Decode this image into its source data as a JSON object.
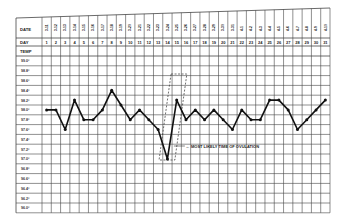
{
  "chart_data": {
    "type": "line",
    "title": "",
    "row_labels": {
      "date": "DATE",
      "day": "DAY",
      "temp": "TEMP"
    },
    "dates": [
      "3-11",
      "3-12",
      "3-13",
      "3-14",
      "3-15",
      "3-16",
      "3-17",
      "3-18",
      "3-19",
      "3-20",
      "3-21",
      "3-22",
      "3-23",
      "3-24",
      "3-25",
      "3-26",
      "3-27",
      "3-28",
      "3-29",
      "3-30",
      "3-31",
      "4-1",
      "4-2",
      "4-3",
      "4-4",
      "4-5",
      "4-6",
      "4-7",
      "4-8",
      "4-9",
      "4-10"
    ],
    "days": [
      1,
      2,
      3,
      4,
      5,
      6,
      7,
      8,
      9,
      10,
      11,
      12,
      13,
      14,
      15,
      16,
      17,
      18,
      19,
      20,
      21,
      22,
      23,
      24,
      25,
      26,
      27,
      28,
      29,
      30,
      31
    ],
    "y_tick_labels": [
      "99.0°",
      "98.8°",
      "98.6°",
      "98.4°",
      "98.2°",
      "98.0°",
      "97.8°",
      "97.6°",
      "97.4°",
      "97.2°",
      "97.0°",
      "96.8°",
      "96.6°",
      "96.4°",
      "96.2°",
      "96.0°"
    ],
    "ylabel": "TEMP",
    "xlabel": "DAY",
    "ylim": [
      96.0,
      99.0
    ],
    "grid": true,
    "series": [
      {
        "name": "Basal body temperature",
        "values": [
          98.0,
          98.0,
          97.6,
          98.2,
          97.8,
          97.8,
          98.0,
          98.4,
          98.1,
          97.8,
          98.0,
          97.8,
          97.6,
          97.0,
          98.2,
          97.8,
          98.0,
          97.8,
          98.0,
          97.8,
          97.6,
          98.0,
          97.8,
          97.8,
          98.2,
          98.2,
          98.0,
          97.6,
          97.8,
          98.0,
          98.2,
          98.0
        ]
      }
    ],
    "annotations": [
      {
        "text": "MOST LIKELY TIME OF OVULATION",
        "days": [
          13,
          15
        ],
        "style": "dashed-parallelogram"
      }
    ],
    "line_color": "#111111",
    "grid_color": "#444444"
  }
}
